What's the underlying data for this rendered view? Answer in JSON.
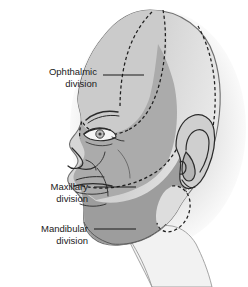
{
  "figure": {
    "name": "trigeminal-nerve-divisions-lateral-head",
    "orientation": "left lateral profile",
    "background_color": "#ffffff"
  },
  "labels": [
    {
      "id": "ophthalmic",
      "line1": "Ophthalmic",
      "line2": "division",
      "text_anchor_x": 97,
      "line1_y": 72,
      "line2_y": 84,
      "leader": {
        "x1": 103,
        "y1": 75,
        "x2": 144,
        "y2": 75
      },
      "region_color": "#c9c9c9"
    },
    {
      "id": "maxillary",
      "line1": "Maxillary",
      "line2": "division",
      "text_anchor_x": 88,
      "line1_y": 184,
      "line2_y": 196,
      "leader": {
        "x1": 94,
        "y1": 187,
        "x2": 136,
        "y2": 187
      },
      "region_color": "#a8a8a8"
    },
    {
      "id": "mandibular",
      "line1": "Mandibular",
      "line2": "division",
      "text_anchor_x": 88,
      "line1_y": 226,
      "line2_y": 238,
      "leader": {
        "x1": 94,
        "y1": 229,
        "x2": 136,
        "y2": 229
      },
      "region_color": "#9a9a9a"
    }
  ],
  "colors": {
    "shadow": "#e3e3e3",
    "scalp_light": "#dcdcdc",
    "ophthalmic_fill": "#c9c9c9",
    "maxillary_fill": "#a9a9a9",
    "mandibular_fill": "#9c9c9c",
    "skin_base": "#d2d2d2",
    "neck_light": "#f0f0f0",
    "outline": "#4a4a4a",
    "dashed_boundary": "#1e1e1e",
    "feature_line": "#2b2b2b",
    "text": "#1a1a1a"
  },
  "anatomy_parts": [
    "cranium",
    "forehead",
    "eyebrow",
    "eye",
    "nose",
    "lips",
    "chin",
    "jaw",
    "ear",
    "neck"
  ]
}
